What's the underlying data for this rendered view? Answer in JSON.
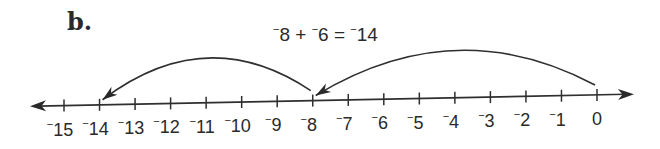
{
  "part_label": "b.",
  "equation": {
    "parts": [
      {
        "text": "⁻",
        "sup": true
      },
      {
        "text": "8 + ",
        "sup": false
      },
      {
        "text": "⁻",
        "sup": true
      },
      {
        "text": "6 = ",
        "sup": false
      },
      {
        "text": "⁻",
        "sup": true
      },
      {
        "text": "14",
        "sup": false
      }
    ],
    "plain": "-8 + -6 = -14",
    "x": 273,
    "y": 41
  },
  "number_line": {
    "min": -15,
    "max": 0,
    "ticks": [
      {
        "value": -15,
        "label": "15",
        "negative": true
      },
      {
        "value": -14,
        "label": "14",
        "negative": true
      },
      {
        "value": -13,
        "label": "13",
        "negative": true
      },
      {
        "value": -12,
        "label": "12",
        "negative": true
      },
      {
        "value": -11,
        "label": "11",
        "negative": true
      },
      {
        "value": -10,
        "label": "10",
        "negative": true
      },
      {
        "value": -9,
        "label": "9",
        "negative": true
      },
      {
        "value": -8,
        "label": "8",
        "negative": true
      },
      {
        "value": -7,
        "label": "7",
        "negative": true
      },
      {
        "value": -6,
        "label": "6",
        "negative": true
      },
      {
        "value": -5,
        "label": "5",
        "negative": true
      },
      {
        "value": -4,
        "label": "4",
        "negative": true
      },
      {
        "value": -3,
        "label": "3",
        "negative": true
      },
      {
        "value": -2,
        "label": "2",
        "negative": true
      },
      {
        "value": -1,
        "label": "1",
        "negative": true
      },
      {
        "value": 0,
        "label": "0",
        "negative": false
      }
    ],
    "geometry": {
      "x_at_min": 64,
      "y_at_min": 105.5,
      "x_at_max": 597,
      "y_at_max": 95,
      "left_arrow_tip_x": 30,
      "right_arrow_tip_x": 634,
      "tick_half_len": 6,
      "label_offset_y": 30
    },
    "arrows_both_ends": true
  },
  "jumps": [
    {
      "from": 0,
      "to": -8,
      "delta": -8,
      "apex_height": 48
    },
    {
      "from": -8,
      "to": -14,
      "delta": -6,
      "apex_height": 45
    }
  ],
  "colors": {
    "ink": "#2f2f2f",
    "background": "#ffffff"
  }
}
